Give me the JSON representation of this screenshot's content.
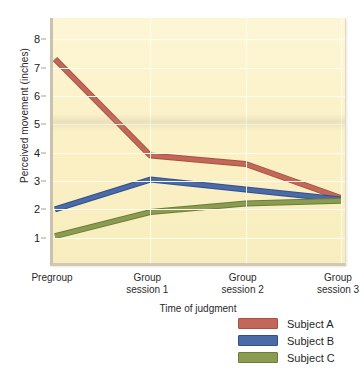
{
  "chart_data": {
    "type": "line",
    "title": "",
    "xlabel": "Time of judgment",
    "ylabel": "Perceived movement (inches)",
    "categories": [
      "Pregroup",
      "Group session 1",
      "Group session 2",
      "Group session 3"
    ],
    "category_lines": [
      [
        "Pregroup",
        ""
      ],
      [
        "Group",
        "session 1"
      ],
      [
        "Group",
        "session 2"
      ],
      [
        "Group",
        "session 3"
      ]
    ],
    "yticks": [
      1,
      2,
      3,
      4,
      5,
      6,
      7,
      8
    ],
    "ylim": [
      0,
      8.75
    ],
    "grid": "horizontal-and-vertical",
    "legend_position": "below-right",
    "series": [
      {
        "name": "Subject A",
        "color": "#c2685a",
        "edge": "#a85140",
        "values": [
          7.3,
          3.9,
          3.6,
          2.4
        ]
      },
      {
        "name": "Subject B",
        "color": "#4a6ba8",
        "edge": "#34508a",
        "values": [
          2.0,
          3.05,
          2.7,
          2.35
        ]
      },
      {
        "name": "Subject C",
        "color": "#8a9c52",
        "edge": "#6c7c3a",
        "values": [
          1.05,
          1.9,
          2.2,
          2.3
        ]
      }
    ]
  },
  "legend": {
    "items": [
      {
        "label": "Subject A"
      },
      {
        "label": "Subject B"
      },
      {
        "label": "Subject C"
      }
    ]
  },
  "colors": {
    "plot_background": "#fbf1c6",
    "gridline": "#fffdf0",
    "axis": "#c9c2ae",
    "subject_a": "#c2685a",
    "subject_b": "#4a6ba8",
    "subject_c": "#8a9c52"
  }
}
